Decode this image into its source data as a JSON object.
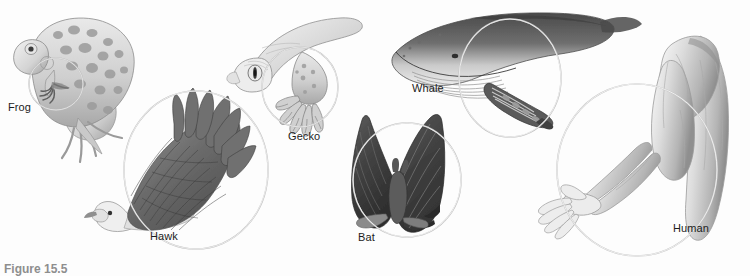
{
  "figure": {
    "caption": "Figure 15.5",
    "background_color": "#fdfdfd",
    "ink_color": "#4a4a4a",
    "circle_color": "#b8b8b8",
    "label_color": "#1c1c1c",
    "title_hidden": ""
  },
  "specimens": [
    {
      "id": "frog",
      "label": "Frog",
      "highlight_shape": "circle",
      "highlight": {
        "cx": 56,
        "cy": 84,
        "rx": 27,
        "ry": 26
      },
      "highlighted_part": "forelimb"
    },
    {
      "id": "hawk",
      "label": "Hawk",
      "highlight_shape": "circle",
      "highlight": {
        "cx": 196,
        "cy": 170,
        "rx": 72,
        "ry": 79
      },
      "highlighted_part": "wing"
    },
    {
      "id": "gecko",
      "label": "Gecko",
      "highlight_shape": "circle",
      "highlight": {
        "cx": 300,
        "cy": 87,
        "rx": 38,
        "ry": 40
      },
      "highlighted_part": "forelimb"
    },
    {
      "id": "whale",
      "label": "Whale",
      "highlight_shape": "circle",
      "highlight": {
        "cx": 510,
        "cy": 78,
        "rx": 51,
        "ry": 59
      },
      "highlighted_part": "flipper"
    },
    {
      "id": "bat",
      "label": "Bat",
      "highlight_shape": "circle",
      "highlight": {
        "cx": 407,
        "cy": 180,
        "rx": 54,
        "ry": 57
      },
      "highlighted_part": "wing"
    },
    {
      "id": "human",
      "label": "Human",
      "highlight_shape": "circle",
      "highlight": {
        "cx": 637,
        "cy": 170,
        "rx": 80,
        "ry": 86
      },
      "highlighted_part": "arm-and-hand"
    }
  ]
}
